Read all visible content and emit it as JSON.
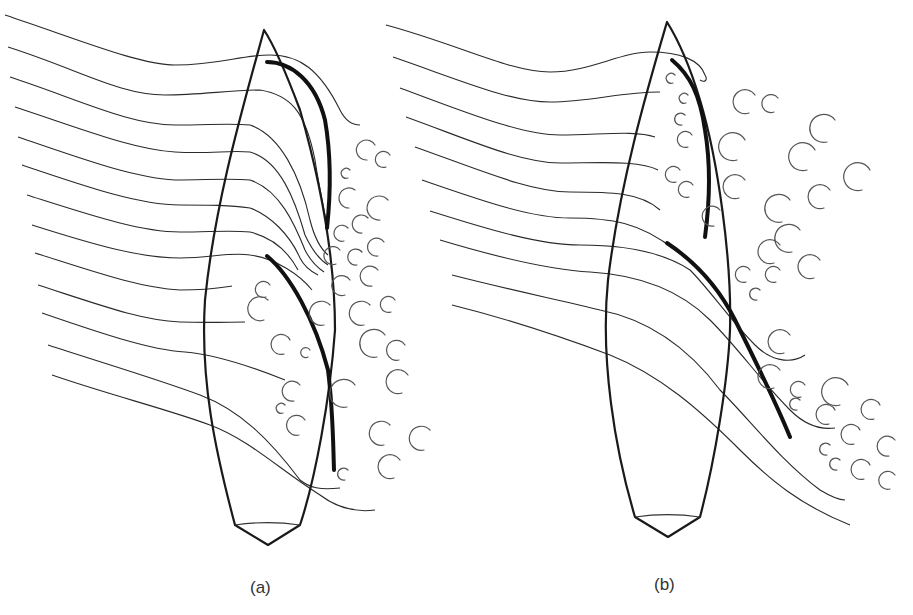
{
  "figure": {
    "panels": [
      {
        "id": "a",
        "label": "(a)",
        "description": "Sailboat hull with jib and mainsail; streamlines curve around sails with turbulent eddies to leeward"
      },
      {
        "id": "b",
        "label": "(b)",
        "description": "Sailboat hull with sails trimmed differently; streamlines separate earlier with large turbulent wake"
      }
    ],
    "elements": {
      "hull": "boat-hull-outline",
      "jib": "jib-sail",
      "mainsail": "mainsail",
      "streamlines": "airflow-streamlines",
      "eddies": "turbulent-eddies"
    },
    "colors": {
      "line": "#1a1a1a",
      "eddy": "#555555",
      "background": "#ffffff"
    }
  }
}
